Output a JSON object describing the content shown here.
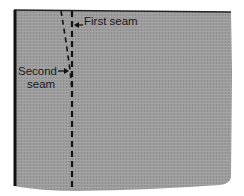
{
  "diagram": {
    "labels": {
      "first_seam": "First seam",
      "second_seam_line1": "Second",
      "second_seam_line2": "seam"
    },
    "colors": {
      "fabric": "#9a9a9a",
      "seam": "#111111",
      "edge": "#1a1a1a",
      "background": "#ffffff"
    }
  }
}
